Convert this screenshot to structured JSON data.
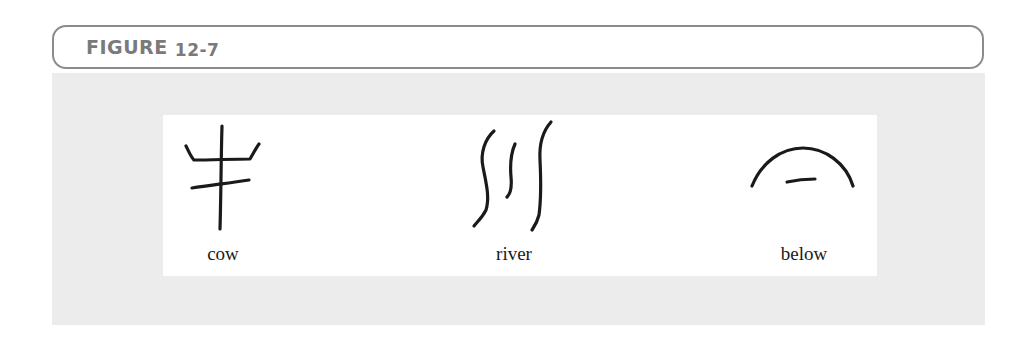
{
  "figure": {
    "label": "FIGURE",
    "number": "12-7",
    "colors": {
      "header_border": "#8c8c8c",
      "header_text": "#7a7a7a",
      "panel_background": "#ececec",
      "inner_background": "#ffffff",
      "ink": "#1a1a1a"
    },
    "glyphs": [
      {
        "name": "cow",
        "label": "cow"
      },
      {
        "name": "river",
        "label": "river"
      },
      {
        "name": "below",
        "label": "below"
      }
    ]
  }
}
